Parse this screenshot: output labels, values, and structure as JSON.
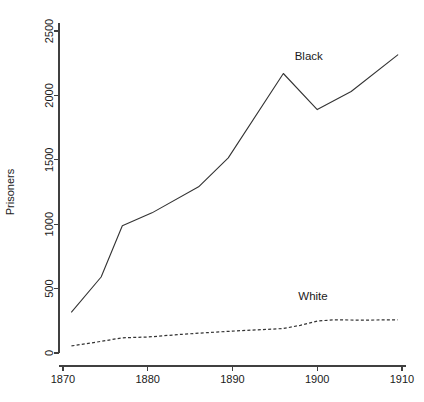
{
  "chart_data": {
    "type": "line",
    "title": "",
    "xlabel": "",
    "ylabel": "Prisoners",
    "xlim": [
      1868.5,
      1910.5
    ],
    "ylim": [
      -95,
      2620
    ],
    "grid": false,
    "legend_position": "inline-labels",
    "xticks": [
      1870,
      1880,
      1890,
      1900,
      1910
    ],
    "xtick_labels": [
      "1870",
      "1880",
      "1890",
      "1900",
      "1910"
    ],
    "yticks": [
      0,
      500,
      1000,
      1500,
      2000,
      2500
    ],
    "ytick_labels": [
      "0",
      "500",
      "1000",
      "1500",
      "2000",
      "2500"
    ],
    "series": [
      {
        "name": "Black",
        "style": "solid",
        "label": "Black",
        "label_x": 1899,
        "label_y": 2275,
        "x": [
          1871,
          1874.5,
          1877,
          1880.5,
          1886,
          1889.5,
          1896,
          1900,
          1904,
          1909.5
        ],
        "values": [
          318,
          590,
          988,
          1088,
          1290,
          1515,
          2170,
          1890,
          2030,
          2315
        ]
      },
      {
        "name": "White",
        "style": "dashed",
        "label": "White",
        "label_x": 1899.5,
        "label_y": 410,
        "x": [
          1871,
          1874,
          1877,
          1880,
          1884,
          1887,
          1890,
          1893,
          1896,
          1898,
          1900,
          1902,
          1905,
          1909.5
        ],
        "values": [
          55,
          85,
          118,
          124,
          145,
          158,
          170,
          180,
          190,
          215,
          248,
          258,
          255,
          258
        ]
      }
    ]
  },
  "axes": {
    "y_axis_title": "Prisoners"
  }
}
